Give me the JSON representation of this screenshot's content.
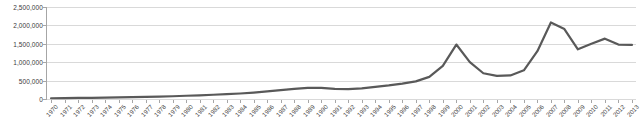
{
  "chart_data": {
    "type": "line",
    "title": "",
    "xlabel": "",
    "ylabel": "",
    "grid": "horizontal",
    "legend": "none",
    "ylim": [
      0,
      2500000
    ],
    "ytick_labels": [
      "0",
      "500,000",
      "1,000,000",
      "1,500,000",
      "2,000,000",
      "2,500,000"
    ],
    "ytick_values": [
      0,
      500000,
      1000000,
      1500000,
      2000000,
      2500000
    ],
    "line_color": "#595959",
    "line_width": 2.2,
    "categories": [
      "1970",
      "1971",
      "1972",
      "1973",
      "1974",
      "1975",
      "1976",
      "1977",
      "1978",
      "1979",
      "1980",
      "1981",
      "1982",
      "1983",
      "1984",
      "1985",
      "1986",
      "1987",
      "1988",
      "1989",
      "1990",
      "1991",
      "1992",
      "1993",
      "1994",
      "1995",
      "1996",
      "1997",
      "1998",
      "1999",
      "2000",
      "2001",
      "2002",
      "2003",
      "2004",
      "2005",
      "2006",
      "2007",
      "2008",
      "2009",
      "2010",
      "2011",
      "2012",
      "2013"
    ],
    "values": [
      20000,
      24000,
      28000,
      33000,
      38000,
      44000,
      50000,
      57000,
      65000,
      75000,
      88000,
      100000,
      115000,
      130000,
      150000,
      175000,
      205000,
      240000,
      275000,
      305000,
      300000,
      275000,
      270000,
      290000,
      330000,
      370000,
      420000,
      480000,
      600000,
      900000,
      1480000,
      1000000,
      700000,
      630000,
      640000,
      780000,
      1300000,
      2080000,
      1900000,
      1350000,
      1500000,
      1640000,
      1480000,
      1470000
    ]
  }
}
